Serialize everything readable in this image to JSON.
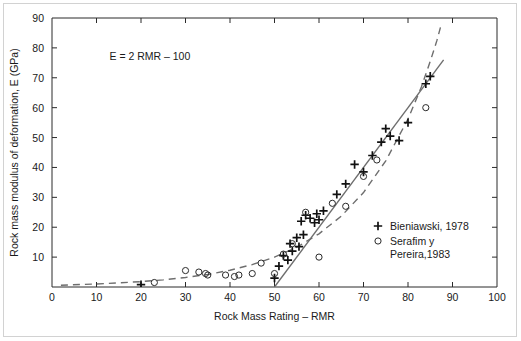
{
  "chart_data": {
    "type": "scatter",
    "title": "",
    "xlabel": "Rock Mass Rating – RMR",
    "ylabel": "Rock mass modulus of deformation, E (GPa)",
    "xlim": [
      0,
      100
    ],
    "ylim": [
      0,
      90
    ],
    "xticks": [
      0,
      10,
      20,
      30,
      40,
      50,
      60,
      70,
      80,
      90,
      100
    ],
    "yticks": [
      0,
      10,
      20,
      30,
      40,
      50,
      60,
      70,
      80,
      90
    ],
    "grid": false,
    "legend_position": "center-right",
    "annotations": [
      {
        "text": "E = 2 RMR – 100",
        "x": 22,
        "y": 76
      }
    ],
    "series": [
      {
        "name": "Bieniawski, 1978",
        "marker": "plus",
        "points": [
          [
            20,
            0.8
          ],
          [
            50,
            3.0
          ],
          [
            51,
            7.0
          ],
          [
            52,
            10.5
          ],
          [
            53,
            9.0
          ],
          [
            53.5,
            14.5
          ],
          [
            54,
            12.0
          ],
          [
            55,
            16.5
          ],
          [
            55.5,
            13.5
          ],
          [
            56,
            22.0
          ],
          [
            56.5,
            17.5
          ],
          [
            57,
            24.0
          ],
          [
            58,
            23.0
          ],
          [
            59,
            21.5
          ],
          [
            59.5,
            24.5
          ],
          [
            60,
            22.5
          ],
          [
            61,
            25.5
          ],
          [
            64,
            31.0
          ],
          [
            66,
            34.5
          ],
          [
            68,
            41.0
          ],
          [
            70,
            38.5
          ],
          [
            72,
            44.0
          ],
          [
            74,
            48.5
          ],
          [
            75,
            53.0
          ],
          [
            76,
            50.5
          ],
          [
            78,
            49.0
          ],
          [
            80,
            55.0
          ],
          [
            84,
            68.0
          ],
          [
            85,
            70.5
          ]
        ]
      },
      {
        "name": "Serafim y Pereira,1983",
        "marker": "circle",
        "points": [
          [
            23,
            1.5
          ],
          [
            30,
            5.5
          ],
          [
            33,
            5.0
          ],
          [
            34.5,
            4.5
          ],
          [
            35,
            4.0
          ],
          [
            39,
            4.0
          ],
          [
            41,
            3.5
          ],
          [
            42,
            4.0
          ],
          [
            45,
            4.5
          ],
          [
            47,
            8.0
          ],
          [
            50,
            4.5
          ],
          [
            52,
            11.0
          ],
          [
            54,
            14.5
          ],
          [
            57,
            25.0
          ],
          [
            60,
            10.0
          ],
          [
            63,
            28.0
          ],
          [
            66,
            27.0
          ],
          [
            70,
            37.0
          ],
          [
            73,
            42.5
          ],
          [
            84,
            60.0
          ]
        ]
      }
    ],
    "fit_lines": [
      {
        "name": "bieniawski-fit-line",
        "style": "solid",
        "equation": "E = 2 RMR - 100",
        "points": [
          [
            50,
            0
          ],
          [
            88,
            76
          ]
        ]
      },
      {
        "name": "serafim-pereira-fit-curve",
        "style": "dashed",
        "equation": "E = 10^((RMR-10)/40)",
        "points": [
          [
            2,
            0.6
          ],
          [
            10,
            1.0
          ],
          [
            20,
            1.8
          ],
          [
            25,
            2.4
          ],
          [
            30,
            3.2
          ],
          [
            35,
            4.2
          ],
          [
            40,
            5.6
          ],
          [
            45,
            7.5
          ],
          [
            50,
            10.0
          ],
          [
            55,
            13.3
          ],
          [
            60,
            17.8
          ],
          [
            65,
            23.7
          ],
          [
            70,
            31.6
          ],
          [
            75,
            42.2
          ],
          [
            80,
            56.2
          ],
          [
            83,
            66.9
          ],
          [
            85,
            75.5
          ],
          [
            86.5,
            82.5
          ],
          [
            87.5,
            88.0
          ]
        ]
      }
    ],
    "legend": [
      {
        "marker": "plus",
        "label": "Bieniawski, 1978"
      },
      {
        "marker": "circle",
        "label": "Serafim y",
        "label2": "Pereira,1983"
      }
    ]
  }
}
